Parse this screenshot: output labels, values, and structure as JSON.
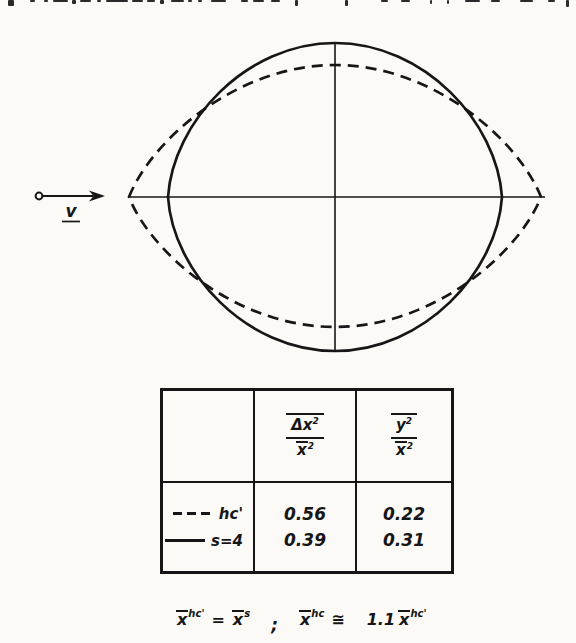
{
  "figure": {
    "velocity_label": "v",
    "legend": {
      "dashed": "hc'",
      "solid": "s=4"
    }
  },
  "table": {
    "col2_header": {
      "num_base": "Δx",
      "num_sup": "2",
      "den_base": "x",
      "den_sup": "2"
    },
    "col3_header": {
      "num_base": "y",
      "num_sup": "2",
      "den_base": "x",
      "den_sup": "2"
    },
    "rows": [
      {
        "label": "hc'",
        "line_style": "dashed",
        "dx2_over_x2": "0.56",
        "y2_over_x2": "0.22"
      },
      {
        "label": "s=4",
        "line_style": "solid",
        "dx2_over_x2": "0.39",
        "y2_over_x2": "0.31"
      }
    ]
  },
  "formula": {
    "base": "x",
    "sup1": "hc'",
    "equals": "=",
    "sup2": "s",
    "separator": ";",
    "sup3": "hc",
    "approx": "≅",
    "coefficient": "1.1",
    "sup4": "hc'"
  }
}
